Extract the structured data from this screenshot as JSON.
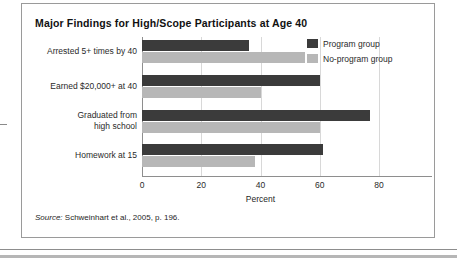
{
  "figure": {
    "title": "Major Findings for High/Scope Participants at Age 40",
    "source_label": "Source:",
    "source_text": " Schweinhart et al., 2005, p. 196."
  },
  "chart_data": {
    "type": "bar",
    "orientation": "horizontal",
    "title": "Major Findings for High/Scope Participants at Age 40",
    "xlabel": "Percent",
    "ylabel": "",
    "xlim": [
      0,
      80
    ],
    "xticks": [
      0,
      20,
      40,
      60,
      80
    ],
    "xtick_labels": [
      "0",
      "20",
      "40",
      "60",
      "80"
    ],
    "grid": "vertical",
    "legend_position": "top-right",
    "categories": [
      "Arrested 5+ times by 40",
      "Earned $20,000+ at 40",
      "Graduated from high school",
      "Homework at 15"
    ],
    "category_lines": [
      [
        "Arrested 5+ times by 40"
      ],
      [
        "Earned $20,000+ at 40"
      ],
      [
        "Graduated from",
        "high school"
      ],
      [
        "Homework at 15"
      ]
    ],
    "series": [
      {
        "name": "Program group",
        "color": "#3b3b3b",
        "values": [
          36,
          60,
          77,
          61
        ]
      },
      {
        "name": "No-program group",
        "color": "#b7b7b7",
        "values": [
          55,
          40,
          60,
          38
        ]
      }
    ]
  }
}
